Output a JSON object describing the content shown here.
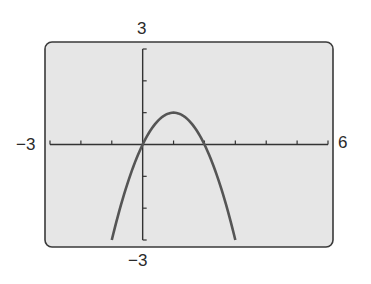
{
  "chart_data": {
    "type": "line",
    "title": "",
    "xlabel": "",
    "ylabel": "",
    "xlim": [
      -3,
      6
    ],
    "ylim": [
      -3,
      3
    ],
    "xscale": 1,
    "yscale": 1,
    "grid": false,
    "window_labels": {
      "xmin": "−3",
      "xmax": "6",
      "ymin": "−3",
      "ymax": "3"
    },
    "series": [
      {
        "name": "y = -x^2 + 2x",
        "x": [
          -1,
          -0.5,
          0,
          0.5,
          1,
          1.5,
          2,
          2.5,
          3
        ],
        "y": [
          -3,
          -1.25,
          0,
          0.75,
          1,
          0.75,
          0,
          -1.25,
          -3
        ]
      }
    ],
    "key_points": {
      "vertex": [
        1,
        1
      ],
      "x_intercepts": [
        0,
        2
      ]
    }
  },
  "colors": {
    "screen_bg": "#e6e6e6",
    "frame": "#3a3a3a",
    "axes": "#333333",
    "curve": "#555555"
  }
}
